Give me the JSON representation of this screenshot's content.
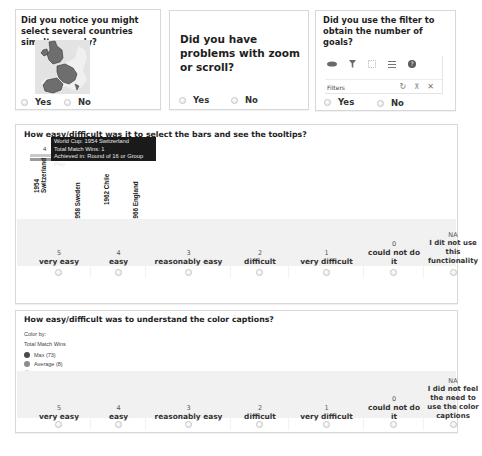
{
  "q1": {
    "title": "Did you notice you might select several countries simultaneously?",
    "options": [
      "Yes",
      "No"
    ]
  },
  "q2": {
    "title": "Did you have problems with zoom or scroll?",
    "options": [
      "Yes",
      "No"
    ]
  },
  "q3": {
    "title": "Did you use the filter to obtain the number of goals?",
    "toolbar": {
      "icons": [
        "lasso-icon",
        "filter-icon",
        "select-rectangle-icon",
        "menu-icon",
        "help-icon"
      ],
      "filters_label": "Filters",
      "row_icons": [
        "reset-icon",
        "pin-icon",
        "close-icon"
      ]
    },
    "options": [
      "Yes",
      "No"
    ]
  },
  "q4": {
    "title": "How easy/difficult was it to select the bars and see the tooltips?",
    "chart": {
      "value_label": "4",
      "bars": [
        "1954 Switzerland",
        "1958 Sweden",
        "1962 Chile",
        "1966 England"
      ],
      "bar_lines": [
        [
          "1954",
          "Switzerland"
        ],
        [
          "1958 Sweden"
        ],
        [
          "1962 Chile"
        ],
        [
          "1966 England"
        ]
      ],
      "tooltip": [
        "World Cup: 1954 Switzerland",
        "Total Match Wins: 1",
        "Achieved in: Round of 16 or Group Play"
      ]
    },
    "scale": [
      {
        "num": "5",
        "label": "very easy"
      },
      {
        "num": "4",
        "label": "easy"
      },
      {
        "num": "3",
        "label": "reasonably easy"
      },
      {
        "num": "2",
        "label": "difficult"
      },
      {
        "num": "1",
        "label": "very difficult"
      },
      {
        "num": "0",
        "label": "could not do it"
      },
      {
        "num": "NA",
        "label": "I dit not use this functionality"
      }
    ]
  },
  "q5": {
    "title": "How easy/difficult was to understand the color captions?",
    "legend": {
      "heading": "Color by:",
      "measure": "Total Match Wins",
      "items": [
        {
          "label": "Max (73)",
          "color": "#4a4a4a"
        },
        {
          "label": "Average (8)",
          "color": "#8c8c8c"
        },
        {
          "label": "Min (1)",
          "color": "#e0e0e0"
        },
        {
          "label": "No Value (0)",
          "color": "#6e6e6e"
        }
      ]
    },
    "scale": [
      {
        "num": "5",
        "label": "very easy"
      },
      {
        "num": "4",
        "label": "easy"
      },
      {
        "num": "3",
        "label": "reasonably easy"
      },
      {
        "num": "2",
        "label": "difficult"
      },
      {
        "num": "1",
        "label": "very difficult"
      },
      {
        "num": "0",
        "label": "could not do it"
      },
      {
        "num": "NA",
        "label": "I did not feel the need to use the color captions"
      }
    ]
  }
}
